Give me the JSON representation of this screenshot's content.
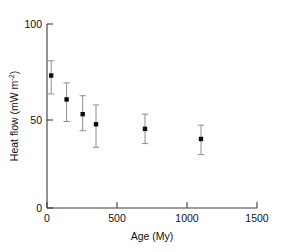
{
  "chart_data": {
    "type": "scatter",
    "title": "",
    "xlabel": "Age (My)",
    "ylabel": "Heat flow (mW  m",
    "ylabel_sup": "-2",
    "ylabel_tail": ")",
    "xlim": [
      0,
      1500
    ],
    "ylim": [
      0,
      100
    ],
    "xticks": [
      0,
      500,
      1000,
      1500
    ],
    "xticklabels": [
      "0",
      "500",
      "1000",
      "1500"
    ],
    "yticks": [
      0,
      50,
      100
    ],
    "yticklabels": [
      "0",
      "50",
      "100"
    ],
    "grid": false,
    "legend": null,
    "x": [
      30,
      140,
      255,
      350,
      700,
      1100
    ],
    "values": [
      72,
      59,
      51,
      45.5,
      43,
      37.5
    ],
    "yerr_low": [
      62,
      47,
      42,
      33,
      35,
      29
    ],
    "yerr_high": [
      80,
      68,
      61,
      56,
      51,
      45
    ],
    "marker": "filled-square",
    "marker_color": "#0b0b0b",
    "errorbar_color": "#8e8e8e"
  },
  "axes": {
    "x_tick_0": "0",
    "x_tick_1": "500",
    "x_tick_2": "1000",
    "x_tick_3": "1500",
    "y_tick_0": "0",
    "y_tick_1": "50",
    "y_tick_2": "100",
    "x_title": "Age (My)",
    "y_title_main": "Heat flow (mW  m",
    "y_title_sup": "-2",
    "y_title_close": ")"
  }
}
